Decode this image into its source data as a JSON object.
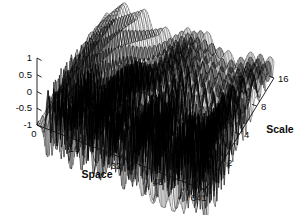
{
  "figure": {
    "title": "",
    "background_color": "#ffffff",
    "mesh_color": "#000000",
    "axis_color": "#111111"
  },
  "axes": {
    "z": {
      "label": "",
      "ticks": [
        "1",
        "0.5",
        "0",
        "-0.5",
        "-1"
      ],
      "values": [
        1,
        0.5,
        0,
        -0.5,
        -1
      ],
      "min": -1,
      "max": 1
    },
    "x": {
      "label": "Space",
      "ticks": [
        "0",
        "16",
        "32",
        "48",
        "64"
      ],
      "values": [
        0,
        16,
        32,
        48,
        64
      ],
      "min": 0,
      "max": 64
    },
    "y": {
      "label": "Scale",
      "ticks": [
        "1",
        "2",
        "4",
        "8",
        "16"
      ],
      "values": [
        1,
        2,
        4,
        8,
        16
      ],
      "min": 1,
      "max": 16,
      "scale_type": "log2"
    }
  },
  "chart_data": {
    "type": "surface",
    "title": "",
    "xlabel": "Space",
    "ylabel": "Scale",
    "zlabel": "",
    "xlim": [
      0,
      64
    ],
    "ylim": [
      1,
      16
    ],
    "zlim": [
      -1,
      1
    ],
    "x_ticks": [
      0,
      16,
      32,
      48,
      64
    ],
    "y_ticks": [
      1,
      2,
      4,
      8,
      16
    ],
    "z_ticks": [
      -1,
      -0.5,
      0,
      0.5,
      1
    ],
    "grid": false,
    "legend": "none",
    "projection": "3d-mesh-wireframe",
    "x": [
      0,
      2,
      4,
      6,
      8,
      10,
      12,
      14,
      16,
      18,
      20,
      22,
      24,
      26,
      28,
      30,
      32,
      34,
      36,
      38,
      40,
      42,
      44,
      46,
      48,
      50,
      52,
      54,
      56,
      58,
      60,
      62,
      64
    ],
    "y": [
      1,
      2,
      4,
      8,
      16
    ],
    "series": [
      {
        "name": "scale=1",
        "values": [
          0.0,
          0.95,
          -0.92,
          0.93,
          -0.9,
          0.94,
          -0.91,
          0.92,
          -0.89,
          0.93,
          -0.9,
          0.91,
          -0.88,
          0.92,
          -0.89,
          0.9,
          -0.87,
          0.91,
          -0.88,
          0.89,
          -0.86,
          0.9,
          -0.87,
          0.88,
          -0.85,
          0.89,
          -0.86,
          0.87,
          -0.84,
          0.88,
          -0.85,
          0.86,
          -0.83
        ]
      },
      {
        "name": "scale=2",
        "values": [
          0.0,
          0.62,
          0.78,
          -0.55,
          -0.72,
          0.6,
          0.8,
          -0.52,
          -0.7,
          0.64,
          0.82,
          -0.5,
          -0.68,
          0.66,
          0.84,
          -0.48,
          -0.66,
          0.68,
          0.8,
          -0.46,
          -0.64,
          0.7,
          0.78,
          -0.44,
          -0.62,
          0.72,
          0.76,
          -0.42,
          -0.6,
          0.74,
          0.74,
          -0.4,
          -0.58
        ]
      },
      {
        "name": "scale=4",
        "values": [
          0.0,
          0.34,
          0.62,
          0.75,
          0.55,
          0.1,
          -0.4,
          -0.68,
          -0.55,
          -0.15,
          0.35,
          0.7,
          0.78,
          0.5,
          0.05,
          -0.45,
          -0.72,
          -0.58,
          -0.12,
          0.38,
          0.72,
          0.8,
          0.52,
          0.08,
          -0.42,
          -0.7,
          -0.56,
          -0.1,
          0.4,
          0.74,
          0.76,
          0.45,
          0.02
        ]
      },
      {
        "name": "scale=8",
        "values": [
          0.0,
          0.2,
          0.42,
          0.6,
          0.7,
          0.68,
          0.52,
          0.26,
          -0.04,
          -0.32,
          -0.52,
          -0.6,
          -0.54,
          -0.34,
          -0.06,
          0.24,
          0.5,
          0.66,
          0.7,
          0.6,
          0.4,
          0.14,
          -0.16,
          -0.4,
          -0.56,
          -0.58,
          -0.44,
          -0.2,
          0.1,
          0.38,
          0.58,
          0.66,
          0.6
        ]
      },
      {
        "name": "scale=16",
        "values": [
          0.0,
          0.1,
          0.22,
          0.34,
          0.44,
          0.5,
          0.52,
          0.48,
          0.4,
          0.28,
          0.16,
          0.06,
          0.02,
          0.06,
          0.16,
          0.3,
          0.44,
          0.54,
          0.58,
          0.56,
          0.48,
          0.36,
          0.22,
          0.1,
          0.04,
          0.06,
          0.16,
          0.3,
          0.44,
          0.54,
          0.58,
          0.54,
          0.44
        ]
      }
    ]
  }
}
